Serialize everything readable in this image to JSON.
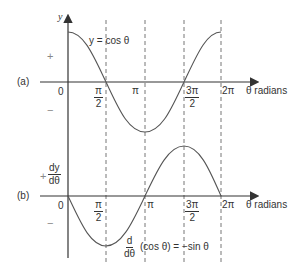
{
  "panel_a": {
    "label": "(a)",
    "y_axis_label": "y",
    "curve_label": "y = cos θ",
    "plus": "+",
    "minus": "−",
    "origin": "0",
    "x_axis_label": "θ radians"
  },
  "panel_b": {
    "label": "(b)",
    "y_axis_label_num": "dy",
    "y_axis_label_den": "dθ",
    "plus": "+",
    "minus": "−",
    "origin": "0",
    "x_axis_label": "θ radians",
    "curve_label_d": "d",
    "curve_label_dtheta": "dθ",
    "curve_label_rest": "(cos θ) = −sin θ"
  },
  "ticks": {
    "pi_over_2_num": "π",
    "pi_over_2_den": "2",
    "pi": "π",
    "three_pi_over_2_num": "3π",
    "three_pi_over_2_den": "2",
    "two_pi": "2π"
  },
  "colors": {
    "axis": "#333333",
    "curve": "#555555",
    "dash": "#777777"
  }
}
